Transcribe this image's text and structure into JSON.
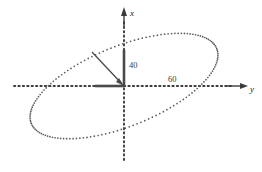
{
  "figure": {
    "type": "plot",
    "background_color": "#ffffff",
    "axes": {
      "vertical": {
        "label": "x",
        "direction": "up",
        "style": "dotted",
        "arrow": true
      },
      "horizontal": {
        "label": "y",
        "direction": "right",
        "style": "dotted",
        "arrow": true
      }
    },
    "annotations": {
      "vertical_segment_value": "40",
      "horizontal_segment_value": "60"
    },
    "colors": {
      "dot": "#5a5a5a",
      "axis": "#3c3c3c",
      "line": "#4a4a4a",
      "text": "#1a1a1a"
    }
  },
  "chart_data": {
    "type": "scatter",
    "title": "",
    "xlabel": "y",
    "ylabel": "x",
    "grid": false,
    "legend": null,
    "ellipse": {
      "center_x": 124,
      "center_y": 86,
      "semi_major": 100,
      "semi_minor": 40,
      "rotation_deg": -22,
      "marker": "dot",
      "n_points": 150
    },
    "series": [
      {
        "name": "ellipse-trace",
        "style": "dotted",
        "points_count": 150
      }
    ],
    "vectors": [
      {
        "name": "radius-vector",
        "from": [
          124,
          86
        ],
        "to": [
          92,
          52
        ],
        "arrow_at": "to",
        "style": "solid"
      },
      {
        "name": "x-component",
        "from": [
          124,
          86
        ],
        "to": [
          124,
          50
        ],
        "style": "bold",
        "label": "40"
      },
      {
        "name": "y-component",
        "from": [
          124,
          86
        ],
        "to": [
          95,
          86
        ],
        "style": "bold"
      }
    ],
    "reference_marks": [
      {
        "label": "40",
        "axis": "x",
        "value": 40
      },
      {
        "label": "60",
        "axis": "y",
        "value": 60
      }
    ]
  }
}
